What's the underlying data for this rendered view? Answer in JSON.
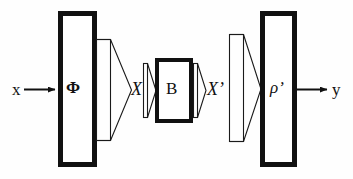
{
  "figure": {
    "type": "block-diagram",
    "background_color": "#fefefe",
    "stroke_color": "#111111"
  },
  "labels": {
    "input": "x",
    "phi": "Φ",
    "signal_X": "X",
    "block_B": "B",
    "signal_Xprime": "X’",
    "rho_prime": "ρ’",
    "output": "y"
  },
  "blocks": [
    {
      "id": "phi-block",
      "label": "Φ",
      "shape": "tall-rectangle",
      "x": 58,
      "y": 11,
      "width": 38,
      "height": 156,
      "stroke_width": 5
    },
    {
      "id": "b-block",
      "label": "B",
      "shape": "rectangle",
      "x": 155,
      "y": 58,
      "width": 38,
      "height": 65,
      "stroke_width": 4
    },
    {
      "id": "rho-block",
      "label": "ρ’",
      "shape": "tall-rectangle",
      "x": 260,
      "y": 11,
      "width": 36,
      "height": 156,
      "stroke_width": 5
    }
  ],
  "cones": [
    {
      "id": "phi-output-cone",
      "attached_to": "phi-block",
      "direction": "right",
      "x": 96,
      "y": 39,
      "width": 36,
      "height": 102,
      "stroke_width": 1
    },
    {
      "id": "b-input-cone",
      "attached_to": "b-block",
      "direction": "right",
      "x": 143,
      "y": 63,
      "width": 12,
      "height": 55,
      "stroke_width": 1
    },
    {
      "id": "b-output-cone",
      "attached_to": "b-block",
      "direction": "right",
      "x": 193,
      "y": 63,
      "width": 12,
      "height": 55,
      "stroke_width": 1
    },
    {
      "id": "rho-input-cone",
      "attached_to": "rho-block",
      "direction": "right",
      "x": 229,
      "y": 33,
      "width": 32,
      "height": 110,
      "stroke_width": 1
    }
  ],
  "arrows": [
    {
      "id": "input-arrow",
      "from_label": "x",
      "to_block": "phi-block",
      "x1": 24,
      "y1": 89,
      "x2": 58,
      "y2": 89,
      "stroke_width": 2,
      "head": "filled-triangle"
    },
    {
      "id": "output-arrow",
      "from_block": "rho-block",
      "to_label": "y",
      "x1": 296,
      "y1": 89,
      "x2": 328,
      "y2": 89,
      "stroke_width": 2,
      "head": "filled-triangle"
    }
  ]
}
